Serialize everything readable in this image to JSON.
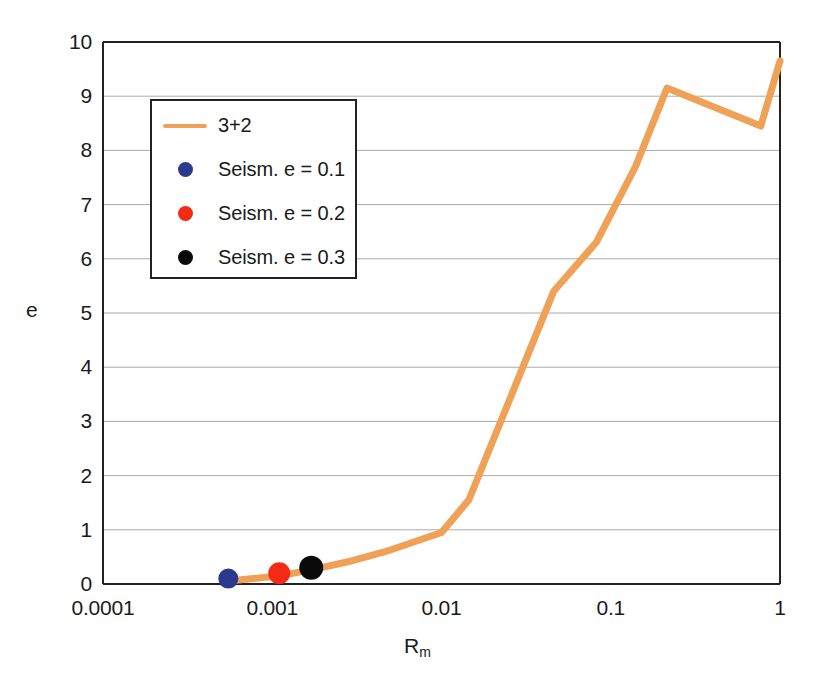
{
  "chart_data": {
    "type": "line",
    "title": "",
    "xlabel": "R_m",
    "xlabel_base": "R",
    "xlabel_sub": "m",
    "ylabel": "e",
    "xscale": "log",
    "yscale": "linear",
    "xlim": [
      0.0001,
      1
    ],
    "ylim": [
      0,
      10
    ],
    "xticks": [
      "0.0001",
      "0.001",
      "0.01",
      "0.1",
      "1"
    ],
    "xtick_values": [
      0.0001,
      0.001,
      0.01,
      0.1,
      1
    ],
    "yticks": [
      "0",
      "1",
      "2",
      "3",
      "4",
      "5",
      "6",
      "7",
      "8",
      "9",
      "10"
    ],
    "ytick_values": [
      0,
      1,
      2,
      3,
      4,
      5,
      6,
      7,
      8,
      9,
      10
    ],
    "grid": "horizontal",
    "legend_position": "upper-left-inside",
    "series": [
      {
        "name": "3+2",
        "type": "line",
        "color": "#EFA257",
        "linewidth": 7,
        "x": [
          0.00061,
          0.0011,
          0.0017,
          0.0028,
          0.0047,
          0.01,
          0.0145,
          0.046,
          0.082,
          0.14,
          0.215,
          0.77,
          1.0
        ],
        "y": [
          0.07,
          0.15,
          0.26,
          0.41,
          0.6,
          0.95,
          1.55,
          5.4,
          6.3,
          7.7,
          9.15,
          8.45,
          9.65
        ]
      },
      {
        "name": "Seism. e = 0.1",
        "type": "scatter",
        "color": "#2B3A8F",
        "marker": "circle",
        "markersize": 20,
        "x": [
          0.00055
        ],
        "y": [
          0.1
        ]
      },
      {
        "name": "Seism. e = 0.2",
        "type": "scatter",
        "color": "#F42A14",
        "marker": "circle",
        "markersize": 22,
        "x": [
          0.0011
        ],
        "y": [
          0.2
        ]
      },
      {
        "name": "Seism. e = 0.3",
        "type": "scatter",
        "color": "#0A0A0A",
        "marker": "circle",
        "markersize": 24,
        "x": [
          0.0017
        ],
        "y": [
          0.3
        ]
      }
    ]
  },
  "legend": {
    "entries": [
      {
        "label": "3+2",
        "key": "line",
        "color": "#EFA257"
      },
      {
        "label": "Seism. e = 0.1",
        "key": "dot",
        "color": "#2B3A8F"
      },
      {
        "label": "Seism. e = 0.2",
        "key": "dot",
        "color": "#F42A14"
      },
      {
        "label": "Seism. e = 0.3",
        "key": "dot",
        "color": "#0A0A0A"
      }
    ]
  },
  "style": {
    "axis_color": "#222222",
    "grid_color": "#AAAAAA",
    "background": "#ffffff"
  }
}
